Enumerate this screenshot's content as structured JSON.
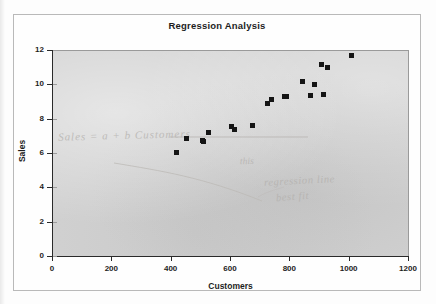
{
  "chart_data": {
    "type": "scatter",
    "title": "Regression Analysis",
    "xlabel": "Customers",
    "ylabel": "Sales",
    "xlim": [
      0,
      1200
    ],
    "ylim": [
      0,
      12
    ],
    "xticks": [
      0,
      200,
      400,
      600,
      800,
      1000,
      1200
    ],
    "yticks": [
      0,
      2,
      4,
      6,
      8,
      10,
      12
    ],
    "xtick_labels": [
      "0",
      "200",
      "400",
      "600",
      "800",
      "1000",
      "1200"
    ],
    "ytick_labels": [
      "0",
      "2",
      "4",
      "6",
      "8",
      "10",
      "12"
    ],
    "grid": false,
    "legend": false,
    "marker": "filled-square",
    "marker_color": "#151515",
    "plot_background": "#d2d2d2",
    "series": [
      {
        "name": "Sales vs Customers",
        "points": [
          [
            420,
            6.1
          ],
          [
            455,
            6.9
          ],
          [
            508,
            6.8
          ],
          [
            512,
            6.7
          ],
          [
            528,
            7.25
          ],
          [
            605,
            7.6
          ],
          [
            615,
            7.4
          ],
          [
            675,
            7.65
          ],
          [
            728,
            8.95
          ],
          [
            740,
            9.2
          ],
          [
            785,
            9.35
          ],
          [
            792,
            9.35
          ],
          [
            845,
            10.2
          ],
          [
            872,
            9.4
          ],
          [
            885,
            10.05
          ],
          [
            908,
            11.2
          ],
          [
            915,
            9.45
          ],
          [
            928,
            11.05
          ],
          [
            1010,
            11.75
          ]
        ]
      }
    ]
  },
  "annotations": {
    "ghost_text_1": "Sales = a + b Customers",
    "ghost_text_2": "this",
    "ghost_text_3": "regression line",
    "ghost_text_4": "best fit"
  }
}
